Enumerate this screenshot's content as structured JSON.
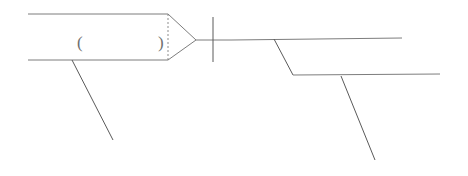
{
  "canvas": {
    "width": 468,
    "height": 176,
    "background": "#ffffff",
    "stroke_color": "#7d7d7d",
    "stroke_color_dark": "#5a5a5a",
    "dashed_stroke_color": "#8d8d8d",
    "stroke_width": 1
  },
  "annotations": {
    "open_paren": "(",
    "close_paren": ")"
  },
  "chart_data": {
    "type": "line",
    "title": "",
    "xlabel": "",
    "ylabel": "",
    "xlim": [
      0,
      468
    ],
    "ylim": [
      0,
      176
    ],
    "grid": false,
    "legend": "none",
    "shapes": [
      {
        "name": "left-body-top-edge",
        "kind": "polyline",
        "points": [
          [
            28,
            14
          ],
          [
            168,
            14
          ]
        ],
        "style": "solid"
      },
      {
        "name": "left-body-bottom-edge",
        "kind": "polyline",
        "points": [
          [
            28,
            60
          ],
          [
            168,
            60
          ]
        ],
        "style": "solid"
      },
      {
        "name": "left-body-dashed-divider",
        "kind": "polyline",
        "points": [
          [
            168,
            14
          ],
          [
            168,
            60
          ]
        ],
        "style": "dashed"
      },
      {
        "name": "arrow-head-upper-edge",
        "kind": "polyline",
        "points": [
          [
            168,
            14
          ],
          [
            196,
            40
          ]
        ],
        "style": "solid"
      },
      {
        "name": "arrow-head-lower-edge",
        "kind": "polyline",
        "points": [
          [
            168,
            60
          ],
          [
            196,
            40
          ]
        ],
        "style": "solid"
      },
      {
        "name": "arrow-tip-stem",
        "kind": "polyline",
        "points": [
          [
            196,
            40
          ],
          [
            232,
            40
          ]
        ],
        "style": "solid"
      },
      {
        "name": "vertical-crossbar",
        "kind": "polyline",
        "points": [
          [
            213,
            17
          ],
          [
            213,
            62
          ]
        ],
        "style": "solid"
      },
      {
        "name": "left-lower-diagonal",
        "kind": "polyline",
        "points": [
          [
            72,
            60
          ],
          [
            113,
            140
          ]
        ],
        "style": "solid"
      },
      {
        "name": "right-upper-horizontal",
        "kind": "polyline",
        "points": [
          [
            232,
            40
          ],
          [
            402,
            38
          ]
        ],
        "style": "solid"
      },
      {
        "name": "right-upper-to-lower-diagonal",
        "kind": "polyline",
        "points": [
          [
            274,
            39
          ],
          [
            293,
            75
          ]
        ],
        "style": "solid"
      },
      {
        "name": "right-lower-horizontal",
        "kind": "polyline",
        "points": [
          [
            293,
            75
          ],
          [
            440,
            74
          ]
        ],
        "style": "solid"
      },
      {
        "name": "right-bottom-diagonal",
        "kind": "polyline",
        "points": [
          [
            341,
            76
          ],
          [
            375,
            160
          ]
        ],
        "style": "solid"
      }
    ],
    "text_labels": [
      {
        "name": "open-paren-label",
        "text": "(",
        "x": 80,
        "y": 44
      },
      {
        "name": "close-paren-label",
        "text": ")",
        "x": 161,
        "y": 44
      }
    ]
  }
}
